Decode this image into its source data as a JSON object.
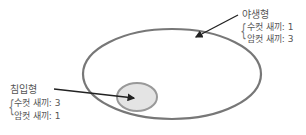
{
  "diagram": {
    "outer_ellipse": {
      "label": "야생형",
      "lines": [
        "수컷 새끼: 1",
        "암컷 새끼: 3"
      ],
      "stroke": "#777777"
    },
    "inner_ellipse": {
      "label": "침입형",
      "lines": [
        "수컷 새끼: 3",
        "암컷 새끼: 1"
      ],
      "stroke": "#999999",
      "fill": "#e4e4e4"
    },
    "arrow_color": "#222222"
  }
}
